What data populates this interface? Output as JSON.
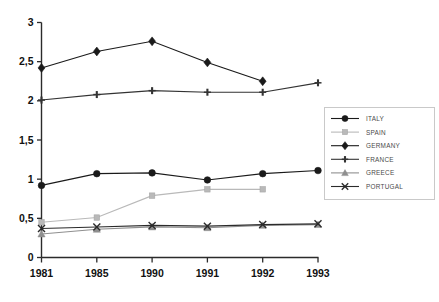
{
  "chart_data": {
    "type": "line",
    "title": "",
    "subtitle": "",
    "xlabel": "",
    "ylabel": "",
    "x": [
      "1981",
      "1985",
      "1990",
      "1991",
      "1992",
      "1993"
    ],
    "categories": [
      "1981",
      "1985",
      "1990",
      "1991",
      "1992",
      "1993"
    ],
    "ylim": [
      0,
      3
    ],
    "yticks": [
      0,
      0.5,
      1,
      1.5,
      2,
      2.5,
      3
    ],
    "ytick_labels": [
      "0",
      "0,5",
      "1",
      "1,5",
      "2",
      "2,5",
      "3"
    ],
    "xtick_labels": [
      "1981",
      "1985",
      "1990",
      "1991",
      "1992",
      "1993"
    ],
    "grid": false,
    "decimal_separator": ",",
    "legend_position": "right",
    "series": [
      {
        "name": "ITALY",
        "marker": "filled-circle",
        "color": "#1a1a1a",
        "values": [
          0.92,
          1.07,
          1.08,
          0.99,
          1.07,
          1.11
        ]
      },
      {
        "name": "SPAIN",
        "marker": "filled-square",
        "color": "#b9b9b9",
        "values": [
          0.45,
          0.51,
          0.79,
          0.87,
          0.87,
          null
        ]
      },
      {
        "name": "GERMANY",
        "marker": "filled-diamond",
        "color": "#1a1a1a",
        "values": [
          2.42,
          2.63,
          2.76,
          2.49,
          2.25,
          null
        ]
      },
      {
        "name": "FRANCE",
        "marker": "plus-cross",
        "color": "#333333",
        "values": [
          2.01,
          2.08,
          2.13,
          2.11,
          2.11,
          2.23
        ]
      },
      {
        "name": "GREECE",
        "marker": "filled-triangle",
        "color": "#8f8f8f",
        "values": [
          0.3,
          0.36,
          0.39,
          0.38,
          0.41,
          0.42
        ]
      },
      {
        "name": "PORTUGAL",
        "marker": "x-cross",
        "color": "#2b2b2b",
        "values": [
          0.37,
          0.39,
          0.41,
          0.4,
          0.42,
          0.43
        ]
      }
    ]
  },
  "legend": {
    "items": [
      {
        "label": "ITALY"
      },
      {
        "label": "SPAIN"
      },
      {
        "label": "GERMANY"
      },
      {
        "label": "FRANCE"
      },
      {
        "label": "GREECE"
      },
      {
        "label": "PORTUGAL"
      }
    ]
  }
}
